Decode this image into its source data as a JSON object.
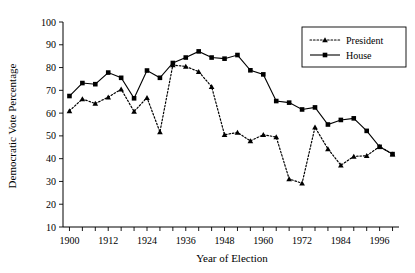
{
  "chart_data": {
    "type": "line",
    "title": "",
    "xlabel": "Year of Election",
    "ylabel": "Democratic Vote Percentage",
    "xlim": [
      1898,
      2002
    ],
    "ylim": [
      10,
      100
    ],
    "ytick_step": 10,
    "xtick_step": 4,
    "xtick_label_step": 12,
    "grid": false,
    "legend_position": "top-right",
    "yticks": [
      10,
      20,
      30,
      40,
      50,
      60,
      70,
      80,
      90,
      100
    ],
    "ytick_labels": [
      "10",
      "20",
      "30",
      "40",
      "50",
      "60",
      "70",
      "80",
      "90",
      "100"
    ],
    "xticks": [
      1900,
      1904,
      1908,
      1912,
      1916,
      1920,
      1924,
      1928,
      1932,
      1936,
      1940,
      1944,
      1948,
      1952,
      1956,
      1960,
      1964,
      1968,
      1972,
      1976,
      1980,
      1984,
      1988,
      1992,
      1996,
      2000
    ],
    "xtick_labels": [
      "1900",
      "1912",
      "1924",
      "1936",
      "1948",
      "1960",
      "1972",
      "1984",
      "1996"
    ],
    "xtick_label_values": [
      1900,
      1912,
      1924,
      1936,
      1948,
      1960,
      1972,
      1984,
      1996
    ],
    "series": [
      {
        "name": "President",
        "marker": "triangle",
        "line_style": "dotted",
        "color": "#000000",
        "x": [
          1900,
          1904,
          1908,
          1912,
          1916,
          1920,
          1924,
          1928,
          1932,
          1936,
          1940,
          1944,
          1948,
          1952,
          1956,
          1960,
          1964,
          1968,
          1972,
          1976,
          1980,
          1984,
          1988,
          1992,
          1996,
          2000
        ],
        "values": [
          61.0,
          66.2,
          64.2,
          67.0,
          70.5,
          60.7,
          66.8,
          51.7,
          81.1,
          80.5,
          78.2,
          71.6,
          50.5,
          51.5,
          47.8,
          50.5,
          49.5,
          31.1,
          29.2,
          53.8,
          44.3,
          37.1,
          41.0,
          41.3,
          45.3,
          42.0
        ]
      },
      {
        "name": "House",
        "marker": "square",
        "line_style": "solid",
        "color": "#000000",
        "x": [
          1900,
          1904,
          1908,
          1912,
          1916,
          1920,
          1924,
          1928,
          1932,
          1936,
          1940,
          1944,
          1948,
          1952,
          1956,
          1960,
          1964,
          1968,
          1972,
          1976,
          1980,
          1984,
          1988,
          1992,
          1996,
          2000
        ],
        "values": [
          67.5,
          73.2,
          72.7,
          77.8,
          75.5,
          66.5,
          78.7,
          75.5,
          82.0,
          84.4,
          87.1,
          84.4,
          83.9,
          85.5,
          78.8,
          77.0,
          65.3,
          64.6,
          61.6,
          62.5,
          55.0,
          57.0,
          57.7,
          52.2,
          45.2,
          42.0
        ]
      }
    ]
  },
  "legend": {
    "entries": [
      {
        "label": "President"
      },
      {
        "label": "House"
      }
    ]
  }
}
